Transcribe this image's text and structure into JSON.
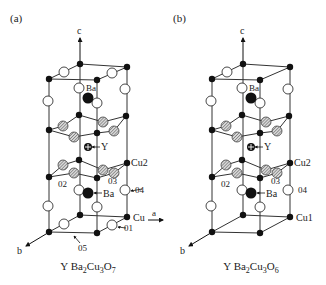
{
  "panels": [
    {
      "id": "a",
      "panel_label": "(a)",
      "caption": {
        "prefix": "Y Ba",
        "s1": "2",
        "mid": "Cu",
        "s2": "3",
        "o": "O",
        "s3": "7"
      },
      "axis_c": "c",
      "axis_a": "a",
      "axis_b": "b",
      "labels": {
        "ba_top": "Ba",
        "y": "Y",
        "cu2": "Cu2",
        "o2": "02",
        "o3": "03",
        "ba_bottom": "Ba",
        "o4": "04",
        "cu1": "Cu",
        "o1": "01",
        "o5": "05"
      }
    },
    {
      "id": "b",
      "panel_label": "(b)",
      "caption": {
        "prefix": "Y Ba",
        "s1": "2",
        "mid": "Cu",
        "s2": "3",
        "o": "O",
        "s3": "6"
      },
      "axis_c": "c",
      "axis_b": "b",
      "labels": {
        "ba_top": "Ba",
        "y": "Y",
        "cu2": "Cu2",
        "o2": "02",
        "o3": "03",
        "ba_bottom": "Ba",
        "o4": "04",
        "cu1": "Cu1"
      }
    }
  ],
  "legend_colors": {
    "cu": "#111111",
    "ba": "#111111",
    "oxygen_apical": "#ffffff",
    "oxygen_plane": "#9a9a9a",
    "line": "#333333"
  }
}
